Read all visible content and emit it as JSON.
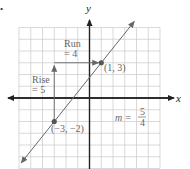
{
  "chart_data": {
    "type": "line",
    "title": "",
    "xlabel": "x",
    "ylabel": "y",
    "xlim": [
      -6,
      6
    ],
    "ylim": [
      -6,
      6
    ],
    "grid": true,
    "points": [
      {
        "x": -3,
        "y": -2,
        "label": "(−3, −2)"
      },
      {
        "x": 1,
        "y": 3,
        "label": "(1, 3)"
      }
    ],
    "line": {
      "slope": 1.25,
      "intercept": 1.75,
      "x_range": [
        -5.8,
        3.8
      ]
    },
    "rise": {
      "label_line1": "Rise",
      "label_line2": "= 5",
      "value": 5
    },
    "run": {
      "label_line1": "Run",
      "label_line2": "= 4",
      "value": 4
    },
    "slope_annotation": {
      "prefix": "m =",
      "numerator": "5",
      "denominator": "4"
    }
  },
  "colors": {
    "grid": "#c8c8c8",
    "axis": "#222222",
    "line": "#666666",
    "point": "#555555",
    "text": "#666666"
  },
  "corner_mark": "•"
}
